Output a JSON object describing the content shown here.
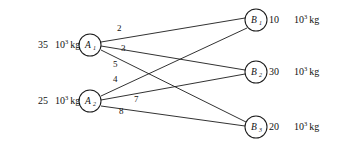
{
  "diagram": {
    "type": "bipartite-graph",
    "line_color": "#1b1b1b",
    "background_color": "#ffffff",
    "unit_label": "10",
    "unit_exponent": "3",
    "unit_suffix": "kg",
    "supply_nodes": [
      {
        "id": "A1",
        "base": "A",
        "subscript": "1",
        "amount": "35",
        "unit_base": "10",
        "unit_exp": "3",
        "unit_suffix": "kg",
        "cx": 90,
        "cy": 45,
        "r": 11
      },
      {
        "id": "A2",
        "base": "A",
        "subscript": "2",
        "amount": "25",
        "unit_base": "10",
        "unit_exp": "3",
        "unit_suffix": "kg",
        "cx": 90,
        "cy": 101,
        "r": 11
      }
    ],
    "demand_nodes": [
      {
        "id": "B1",
        "base": "B",
        "subscript": "1",
        "amount": "10",
        "unit_base": "10",
        "unit_exp": "3",
        "unit_suffix": "kg",
        "cx": 256,
        "cy": 20,
        "r": 11
      },
      {
        "id": "B2",
        "base": "B",
        "subscript": "2",
        "amount": "30",
        "unit_base": "10",
        "unit_exp": "3",
        "unit_suffix": "kg",
        "cx": 256,
        "cy": 72,
        "r": 11
      },
      {
        "id": "B3",
        "base": "B",
        "subscript": "3",
        "amount": "20",
        "unit_base": "10",
        "unit_exp": "3",
        "unit_suffix": "kg",
        "cx": 256,
        "cy": 127,
        "r": 11
      }
    ],
    "edges": [
      {
        "from": "A1",
        "to": "B1",
        "label": "2",
        "lx": 117,
        "ly": 31
      },
      {
        "from": "A1",
        "to": "B2",
        "label": "3",
        "lx": 121,
        "ly": 51
      },
      {
        "from": "A1",
        "to": "B3",
        "label": "5",
        "lx": 113,
        "ly": 67
      },
      {
        "from": "A2",
        "to": "B1",
        "label": "4",
        "lx": 113,
        "ly": 82
      },
      {
        "from": "A2",
        "to": "B2",
        "label": "7",
        "lx": 134,
        "ly": 102
      },
      {
        "from": "A2",
        "to": "B3",
        "label": "8",
        "lx": 119,
        "ly": 114
      }
    ]
  }
}
